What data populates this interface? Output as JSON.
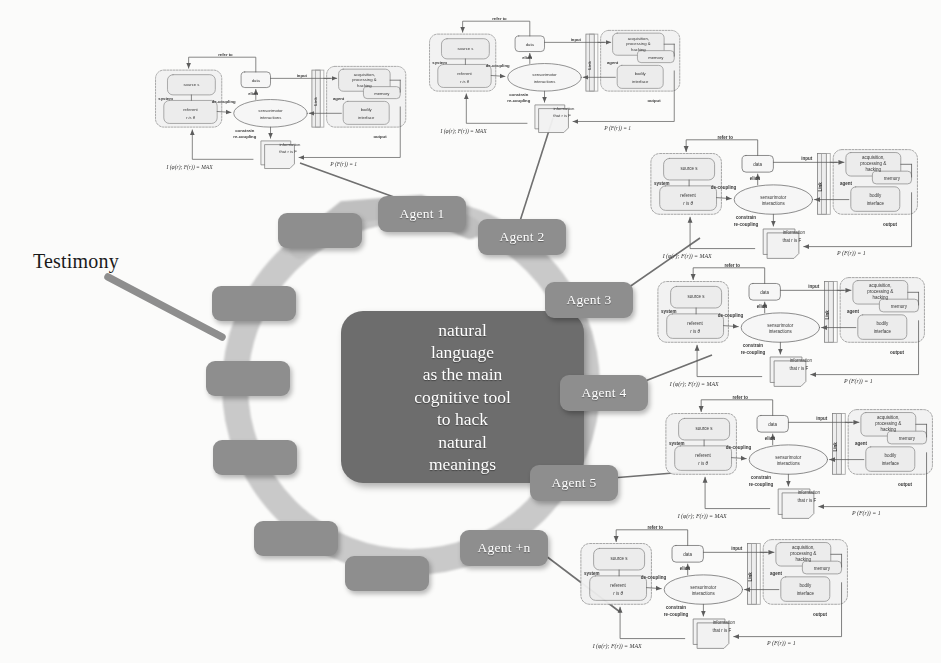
{
  "figure": {
    "testimony_label": "Testimony"
  },
  "center": {
    "lines": [
      "natural",
      "language",
      "as the main",
      "cognitive tool",
      "to hack",
      "natural",
      "meanings"
    ],
    "text": "natural language as the main cognitive tool to hack natural meanings",
    "fill": "#6d6d6d",
    "text_color": "#ffffff"
  },
  "ring": {
    "fill": "#c9c9c9",
    "node_fill": "#8e8e8e",
    "node_text_color": "#ffffff",
    "nodes": [
      {
        "id": "n1",
        "label": "",
        "labeled": false,
        "x": 212,
        "y": 286,
        "w": 84,
        "h": 35
      },
      {
        "id": "n2",
        "label": "",
        "labeled": false,
        "x": 206,
        "y": 361,
        "w": 84,
        "h": 35
      },
      {
        "id": "n3",
        "label": "",
        "labeled": false,
        "x": 213,
        "y": 440,
        "w": 84,
        "h": 35
      },
      {
        "id": "n4",
        "label": "",
        "labeled": false,
        "x": 254,
        "y": 521,
        "w": 84,
        "h": 35
      },
      {
        "id": "n5",
        "label": "",
        "labeled": false,
        "x": 345,
        "y": 556,
        "w": 84,
        "h": 35
      },
      {
        "id": "n6",
        "label": "Agent +n",
        "labeled": true,
        "x": 460,
        "y": 530,
        "w": 88,
        "h": 36
      },
      {
        "id": "n7",
        "label": "Agent 5",
        "labeled": true,
        "x": 530,
        "y": 465,
        "w": 88,
        "h": 36
      },
      {
        "id": "n8",
        "label": "Agent 4",
        "labeled": true,
        "x": 560,
        "y": 375,
        "w": 88,
        "h": 36
      },
      {
        "id": "n9",
        "label": "Agent 3",
        "labeled": true,
        "x": 545,
        "y": 282,
        "w": 88,
        "h": 36
      },
      {
        "id": "n10",
        "label": "Agent 2",
        "labeled": true,
        "x": 478,
        "y": 219,
        "w": 88,
        "h": 36
      },
      {
        "id": "n11",
        "label": "Agent 1",
        "labeled": true,
        "x": 378,
        "y": 196,
        "w": 88,
        "h": 36
      },
      {
        "id": "n12",
        "label": "",
        "labeled": false,
        "x": 278,
        "y": 213,
        "w": 84,
        "h": 35
      }
    ]
  },
  "subdiagram": {
    "count": 6,
    "instances": [
      {
        "x": 150,
        "y": 48,
        "scale": 0.92
      },
      {
        "x": 424,
        "y": 12,
        "scale": 0.92
      },
      {
        "x": 645,
        "y": 130,
        "scale": 0.98
      },
      {
        "x": 652,
        "y": 258,
        "scale": 0.98
      },
      {
        "x": 660,
        "y": 390,
        "scale": 0.98
      },
      {
        "x": 575,
        "y": 520,
        "scale": 0.98
      }
    ],
    "labels": {
      "refer_to": "refer to",
      "system": "system",
      "source": "source s",
      "referent": "referent",
      "referent_value": "r is θ",
      "de_coupling": "de-coupling",
      "data": "data",
      "elicit": "elicit",
      "sensorimotor": "sensorimotor",
      "interactions": "interactions",
      "constrain": "constrain",
      "re_coupling": "re-coupling",
      "information": "information",
      "that_r_is_f": "that r is F",
      "input": "input",
      "output": "output",
      "link": "Link",
      "agent": "agent",
      "acquisition1": "acquisition,",
      "acquisition2": "processing &",
      "acquisition3": "hacking",
      "memory": "memory",
      "bodily": "bodily",
      "interface": "interface",
      "formula_left": "I (φ(r); F(r)) = MAX",
      "formula_right": "P (F(r)) = 1"
    }
  }
}
